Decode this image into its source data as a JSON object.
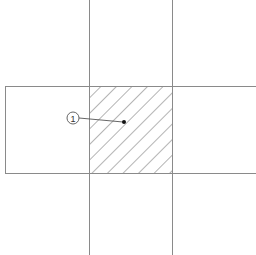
{
  "diagram": {
    "background": "#ffffff",
    "line_color": "#8a8a8a",
    "hatch_color": "#6a6a6a",
    "callouts": [
      {
        "label": "1",
        "target": "hatched-intersection-region"
      }
    ],
    "regions": {
      "vertical_band": {
        "x": 89,
        "width": 83,
        "y": 0,
        "height": 255
      },
      "horizontal_band": {
        "x": 5,
        "width": 251,
        "y": 86,
        "height": 87
      },
      "intersection": {
        "x": 89,
        "y": 86,
        "width": 83,
        "height": 87,
        "fill": "hatched"
      }
    }
  }
}
